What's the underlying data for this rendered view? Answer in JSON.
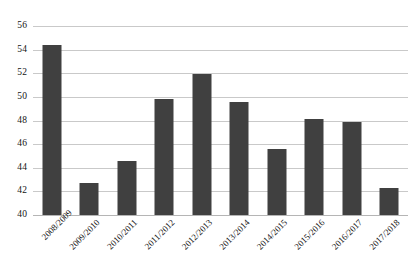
{
  "chart_data": {
    "type": "bar",
    "title": "",
    "subtitle": "",
    "xlabel": "",
    "ylabel": "",
    "categories": [
      "2008/2009",
      "2009/2010",
      "2010/2011",
      "2011/2012",
      "2012/2013",
      "2013/2014",
      "2014/2015",
      "2015/2016",
      "2016/2017",
      "2017/2018"
    ],
    "values": [
      54.4,
      42.7,
      44.6,
      49.8,
      51.9,
      49.6,
      45.6,
      48.1,
      47.9,
      42.3
    ],
    "ylim": [
      40,
      56
    ],
    "yticks": [
      40,
      42,
      44,
      46,
      48,
      50,
      52,
      54,
      56
    ],
    "ytick_labels": [
      "40",
      "42",
      "44",
      "46",
      "48",
      "50",
      "52",
      "54",
      "56"
    ],
    "grid": true,
    "legend": false,
    "legend_position": "none",
    "series": [
      {
        "name": "",
        "values": [
          54.4,
          42.7,
          44.6,
          49.8,
          51.9,
          49.6,
          45.6,
          48.1,
          47.9,
          42.3
        ]
      }
    ],
    "bar_color": "#404040",
    "gridline_color": "#c9c9c9",
    "background_color": "#ffffff",
    "xtick_label_rotation": -45
  }
}
